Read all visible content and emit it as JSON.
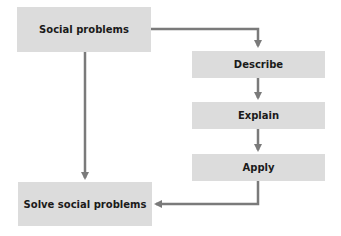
{
  "diagram": {
    "type": "flowchart",
    "colors": {
      "box_fill": "#dcdcdc",
      "arrow": "#7a7a7a",
      "text": "#1a1a1a",
      "background": "#ffffff"
    },
    "nodes": [
      {
        "id": "social",
        "label": "Social problems"
      },
      {
        "id": "describe",
        "label": "Describe"
      },
      {
        "id": "explain",
        "label": "Explain"
      },
      {
        "id": "apply",
        "label": "Apply"
      },
      {
        "id": "solve",
        "label": "Solve social problems"
      }
    ],
    "edges": [
      {
        "from": "social",
        "to": "describe"
      },
      {
        "from": "describe",
        "to": "explain"
      },
      {
        "from": "explain",
        "to": "apply"
      },
      {
        "from": "apply",
        "to": "solve"
      },
      {
        "from": "social",
        "to": "solve"
      }
    ]
  }
}
